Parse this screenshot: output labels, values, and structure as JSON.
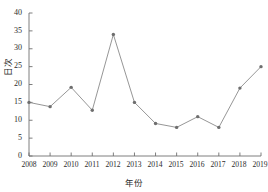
{
  "chart_data": {
    "type": "line",
    "title": "",
    "subtitle": "",
    "xlabel": "年份",
    "ylabel": "日次",
    "categories": [
      "2008",
      "2009",
      "2010",
      "2011",
      "2012",
      "2013",
      "2014",
      "2015",
      "2016",
      "2017",
      "2018",
      "2019"
    ],
    "values": [
      15,
      13.8,
      19.2,
      12.8,
      34,
      15,
      9.1,
      8,
      11,
      8,
      19,
      25
    ],
    "series": [
      {
        "name": "日次",
        "values": [
          15,
          13.8,
          19.2,
          12.8,
          34,
          15,
          9.1,
          8,
          11,
          8,
          19,
          25
        ]
      }
    ],
    "xlim": [
      2008,
      2019
    ],
    "ylim": [
      0,
      40
    ],
    "ytick_values": [
      0,
      5,
      10,
      15,
      20,
      25,
      30,
      35,
      40
    ],
    "ytick_labels": [
      "0",
      "5",
      "10",
      "15",
      "20",
      "25",
      "30",
      "35",
      "40"
    ],
    "xtick_labels": [
      "2008",
      "2009",
      "2010",
      "2011",
      "2012",
      "2013",
      "2014",
      "2015",
      "2016",
      "2017",
      "2018",
      "2019"
    ],
    "grid": false,
    "legend": false,
    "legend_position": "none",
    "marker": "circle",
    "line_color": "#8a8a8a",
    "marker_color": "#6e6e6e",
    "axis_color": "#6f6f6f",
    "background_color": "#ffffff"
  },
  "geometry": {
    "plot_left": 29,
    "plot_right": 261,
    "plot_top": 13,
    "plot_bottom": 156
  }
}
